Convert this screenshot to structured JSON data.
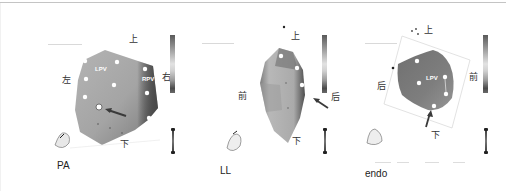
{
  "figure": {
    "panels": [
      {
        "caption": "PA",
        "directions": {
          "top": "上",
          "bottom": "下",
          "left": "左",
          "right": "右"
        },
        "labels": [
          "LPV",
          "RPV"
        ],
        "arrow": "pointing to highlighted site"
      },
      {
        "caption": "LL",
        "directions": {
          "top": "上",
          "bottom": "下",
          "left": "前",
          "right": "后"
        },
        "labels": [],
        "arrow": "pointing to highlighted site"
      },
      {
        "caption": "endo",
        "directions": {
          "top": "上",
          "bottom": "下",
          "left": "后",
          "right": "前"
        },
        "labels": [
          "LPV"
        ],
        "arrow": "pointing to highlighted site"
      }
    ],
    "colors": {
      "surface": "#a8a8a8",
      "surface_dark": "#5c5c5c",
      "marker": "#ffffff",
      "arrow": "#3a3a3a"
    }
  }
}
